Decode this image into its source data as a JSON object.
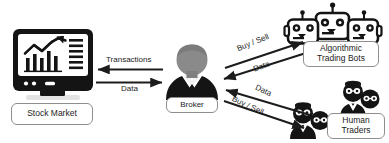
{
  "diagram": {
    "background": "#ffffff",
    "ink": "#1c1c1c",
    "outline": "#8e8e8e",
    "broker_head": "#8a8a8a",
    "nodes": {
      "stock_market": {
        "label": "Stock Market",
        "icon": "monitor-chart-icon"
      },
      "broker": {
        "label": "Broker",
        "icon": "businessman-icon"
      },
      "algorithmic_bots": {
        "label": "Algorithmic\nTrading Bots",
        "icon": "robot-group-icon"
      },
      "human_traders": {
        "label": "Human\nTraders",
        "icon": "people-group-icon"
      }
    },
    "flows": [
      {
        "id": "transactions",
        "label": "Transactions",
        "from": "broker",
        "to": "stock_market",
        "direction": "left"
      },
      {
        "id": "data_to_market",
        "label": "Data",
        "from": "stock_market",
        "to": "broker",
        "direction": "right"
      },
      {
        "id": "buy_sell_bots",
        "label": "Buy / Sell",
        "from": "broker",
        "to": "algorithmic_bots",
        "direction": "up-right"
      },
      {
        "id": "data_bots",
        "label": "Data",
        "from": "algorithmic_bots",
        "to": "broker",
        "direction": "down-left"
      },
      {
        "id": "data_traders",
        "label": "Data",
        "from": "human_traders",
        "to": "broker",
        "direction": "up-left"
      },
      {
        "id": "buy_sell_traders",
        "label": "Buy / Sell",
        "from": "broker",
        "to": "human_traders",
        "direction": "down-right"
      }
    ]
  }
}
